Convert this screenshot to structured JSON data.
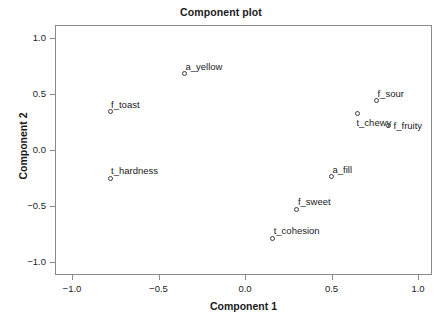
{
  "chart_data": {
    "type": "scatter",
    "title": "Component plot",
    "xlabel": "Component 1",
    "ylabel": "Component 2",
    "xlim": [
      -1.15,
      1.15
    ],
    "ylim": [
      -1.12,
      1.12
    ],
    "grid": false,
    "legend": null,
    "xticks": [
      -1.0,
      -0.5,
      0.0,
      0.5,
      1.0
    ],
    "xtick_labels": [
      "-1.0",
      "-0.5",
      "0.0",
      "0.5",
      "1.0"
    ],
    "yticks": [
      -1.0,
      -0.5,
      0.0,
      0.5,
      1.0
    ],
    "ytick_labels": [
      "-1.0",
      "-0.5",
      "0.0",
      "0.5",
      "1.0"
    ],
    "marker": "open-circle",
    "marker_color": "#3c3c3c",
    "points": [
      {
        "label": "a_yellow",
        "x": -0.35,
        "y": 0.68,
        "label_pos": "top-right"
      },
      {
        "label": "f_toast",
        "x": -0.78,
        "y": 0.34,
        "label_pos": "top-right"
      },
      {
        "label": "t_hardness",
        "x": -0.78,
        "y": -0.25,
        "label_pos": "top-right"
      },
      {
        "label": "f_sour",
        "x": 0.76,
        "y": 0.44,
        "label_pos": "top-right"
      },
      {
        "label": "t_chewy",
        "x": 0.65,
        "y": 0.33,
        "label_pos": "bottom-right"
      },
      {
        "label": "f_fruity",
        "x": 0.83,
        "y": 0.22,
        "label_pos": "right"
      },
      {
        "label": "a_fill",
        "x": 0.5,
        "y": -0.24,
        "label_pos": "top-right"
      },
      {
        "label": "f_sweet",
        "x": 0.3,
        "y": -0.53,
        "label_pos": "top-right"
      },
      {
        "label": "t_cohesion",
        "x": 0.16,
        "y": -0.79,
        "label_pos": "top-right"
      }
    ]
  },
  "axes": {
    "x_tick_labels": [
      "-1.0",
      "-0.5",
      "0.0",
      "0.5",
      "1.0"
    ],
    "y_tick_labels": [
      "1.0",
      "0.5",
      "0.0",
      "-0.5",
      "-1.0"
    ]
  }
}
